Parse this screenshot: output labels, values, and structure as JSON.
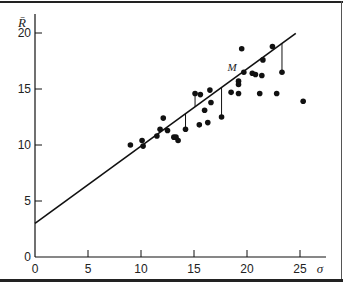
{
  "chart_data": {
    "type": "scatter",
    "title": "",
    "xlabel": "σ",
    "ylabel": "R̄",
    "xlim": [
      0,
      27
    ],
    "ylim": [
      0,
      21
    ],
    "grid": false,
    "legend": null,
    "x_ticks": [
      0,
      5,
      10,
      15,
      20,
      25
    ],
    "y_ticks": [
      0,
      5,
      10,
      15,
      20
    ],
    "points": [
      {
        "x": 9.0,
        "y": 10.0
      },
      {
        "x": 10.1,
        "y": 10.4
      },
      {
        "x": 10.2,
        "y": 9.9
      },
      {
        "x": 11.5,
        "y": 10.8
      },
      {
        "x": 11.8,
        "y": 11.4
      },
      {
        "x": 12.1,
        "y": 12.4
      },
      {
        "x": 12.5,
        "y": 11.3
      },
      {
        "x": 13.1,
        "y": 10.7
      },
      {
        "x": 13.3,
        "y": 10.7
      },
      {
        "x": 13.5,
        "y": 10.4
      },
      {
        "x": 14.2,
        "y": 11.4
      },
      {
        "x": 15.1,
        "y": 14.6
      },
      {
        "x": 15.6,
        "y": 14.5
      },
      {
        "x": 15.5,
        "y": 11.8
      },
      {
        "x": 16.0,
        "y": 13.1
      },
      {
        "x": 16.3,
        "y": 12.0
      },
      {
        "x": 16.5,
        "y": 14.9
      },
      {
        "x": 16.6,
        "y": 13.8
      },
      {
        "x": 17.6,
        "y": 12.5
      },
      {
        "x": 18.5,
        "y": 14.7
      },
      {
        "x": 19.2,
        "y": 15.7
      },
      {
        "x": 19.2,
        "y": 15.4
      },
      {
        "x": 19.2,
        "y": 14.6
      },
      {
        "x": 19.5,
        "y": 18.6
      },
      {
        "x": 19.7,
        "y": 16.5
      },
      {
        "x": 20.5,
        "y": 16.4
      },
      {
        "x": 20.8,
        "y": 16.3
      },
      {
        "x": 21.2,
        "y": 14.6
      },
      {
        "x": 21.4,
        "y": 16.2
      },
      {
        "x": 21.5,
        "y": 17.6
      },
      {
        "x": 22.4,
        "y": 18.8
      },
      {
        "x": 22.8,
        "y": 14.6
      },
      {
        "x": 23.3,
        "y": 16.5
      },
      {
        "x": 25.3,
        "y": 13.9
      }
    ],
    "regression_line": {
      "intercept": 3.0,
      "slope": 0.69,
      "x_start": 0,
      "x_end": 24.6
    },
    "residual_lines": [
      {
        "x": 14.2,
        "y_point": 11.4
      },
      {
        "x": 15.1,
        "y_point": 14.6
      },
      {
        "x": 17.6,
        "y_point": 12.5
      },
      {
        "x": 23.3,
        "y_point": 16.5
      }
    ],
    "annotations": [
      {
        "text": "M",
        "x": 18.6,
        "y": 16.6
      }
    ]
  },
  "plot_area": {
    "origin_px": [
      35,
      257
    ],
    "px_per_x": 10.6,
    "px_per_y": 11.2,
    "x_axis_end_px": 326,
    "y_axis_top_px": 14
  },
  "colors": {
    "ink": "#111111"
  }
}
